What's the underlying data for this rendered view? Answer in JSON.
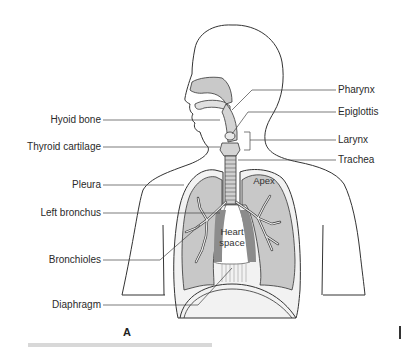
{
  "figure": {
    "panel_letter": "A",
    "labels_left": [
      {
        "text": "Hyoid bone"
      },
      {
        "text": "Thyroid cartilage"
      },
      {
        "text": "Pleura"
      },
      {
        "text": "Left bronchus"
      },
      {
        "text": "Bronchioles"
      },
      {
        "text": "Diaphragm"
      }
    ],
    "labels_right": [
      {
        "text": "Pharynx"
      },
      {
        "text": "Epiglottis"
      },
      {
        "text": "Larynx"
      },
      {
        "text": "Trachea"
      }
    ],
    "inner_labels": {
      "apex": "Apex",
      "heart_space_line1": "Heart",
      "heart_space_line2": "space"
    },
    "colors": {
      "outline": "#333333",
      "lung_fill": "#c8c8c8",
      "airway_fill": "#d4d4d4",
      "heart_shadow": "#8c8c8c",
      "background": "#ffffff"
    }
  }
}
